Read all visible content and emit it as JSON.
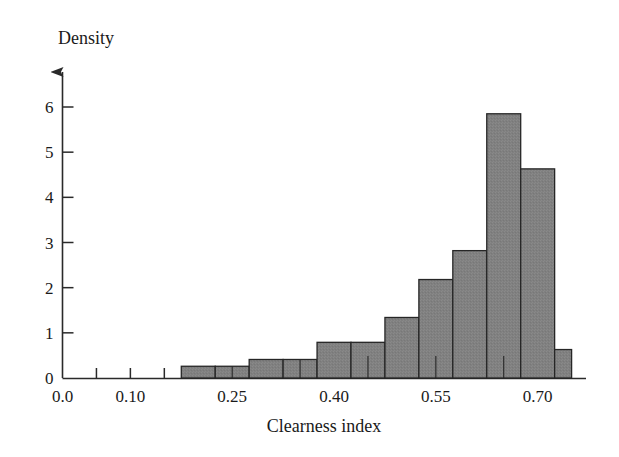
{
  "chart_data": {
    "type": "bar",
    "title": "",
    "subtitle": "",
    "xlabel": "Clearness index",
    "ylabel": "Density",
    "xlim": [
      0.0,
      0.755
    ],
    "ylim": [
      0,
      6.55
    ],
    "grid": false,
    "legend": "none",
    "bin_width": 0.025,
    "x_major_ticks": [
      0.0,
      0.1,
      0.25,
      0.4,
      0.55,
      0.7
    ],
    "x_major_tick_labels": [
      "0.0",
      "0.10",
      "0.25",
      "0.40",
      "0.55",
      "0.70"
    ],
    "x_minor_ticks": [
      0.05,
      0.15,
      0.2,
      0.3,
      0.35,
      0.45,
      0.5,
      0.6,
      0.65
    ],
    "y_ticks": [
      0,
      1,
      2,
      3,
      4,
      5,
      6
    ],
    "y_tick_labels": [
      "0",
      "1",
      "2",
      "3",
      "4",
      "5",
      "6"
    ],
    "bin_edges": [
      0.175,
      0.2,
      0.225,
      0.25,
      0.275,
      0.3,
      0.325,
      0.35,
      0.375,
      0.4,
      0.425,
      0.45,
      0.475,
      0.5,
      0.525,
      0.55,
      0.575,
      0.6,
      0.625,
      0.65,
      0.675,
      0.7,
      0.725,
      0.75
    ],
    "categories": [
      "0.175-0.225",
      "0.225-0.275",
      "0.275-0.325",
      "0.325-0.375",
      "0.375-0.425",
      "0.425-0.475",
      "0.475-0.525",
      "0.525-0.575",
      "0.575-0.625",
      "0.625-0.675",
      "0.675-0.725",
      "0.725-0.750"
    ],
    "bars": [
      {
        "x0": 0.175,
        "x1": 0.225,
        "value": 0.26
      },
      {
        "x0": 0.225,
        "x1": 0.275,
        "value": 0.26
      },
      {
        "x0": 0.275,
        "x1": 0.325,
        "value": 0.41
      },
      {
        "x0": 0.325,
        "x1": 0.375,
        "value": 0.41
      },
      {
        "x0": 0.375,
        "x1": 0.425,
        "value": 0.79
      },
      {
        "x0": 0.425,
        "x1": 0.475,
        "value": 0.79
      },
      {
        "x0": 0.475,
        "x1": 0.525,
        "value": 1.34
      },
      {
        "x0": 0.525,
        "x1": 0.575,
        "value": 2.18
      },
      {
        "x0": 0.575,
        "x1": 0.625,
        "value": 2.82
      },
      {
        "x0": 0.625,
        "x1": 0.675,
        "value": 5.85
      },
      {
        "x0": 0.675,
        "x1": 0.725,
        "value": 4.63
      },
      {
        "x0": 0.725,
        "x1": 0.75,
        "value": 0.63
      }
    ],
    "values": [
      0.26,
      0.26,
      0.41,
      0.41,
      0.79,
      0.79,
      1.34,
      2.18,
      2.82,
      5.85,
      4.63,
      0.63
    ],
    "internal_dividers": [
      0.25,
      0.35,
      0.45,
      0.55,
      0.65
    ],
    "colors": {
      "bar_fill": "#808080",
      "bar_edge": "#262626",
      "axis": "#2a2a2a",
      "text": "#1a1a1a",
      "background": "#ffffff"
    }
  },
  "axes": {
    "y_axis_label": "Density",
    "x_axis_label": "Clearness index"
  }
}
